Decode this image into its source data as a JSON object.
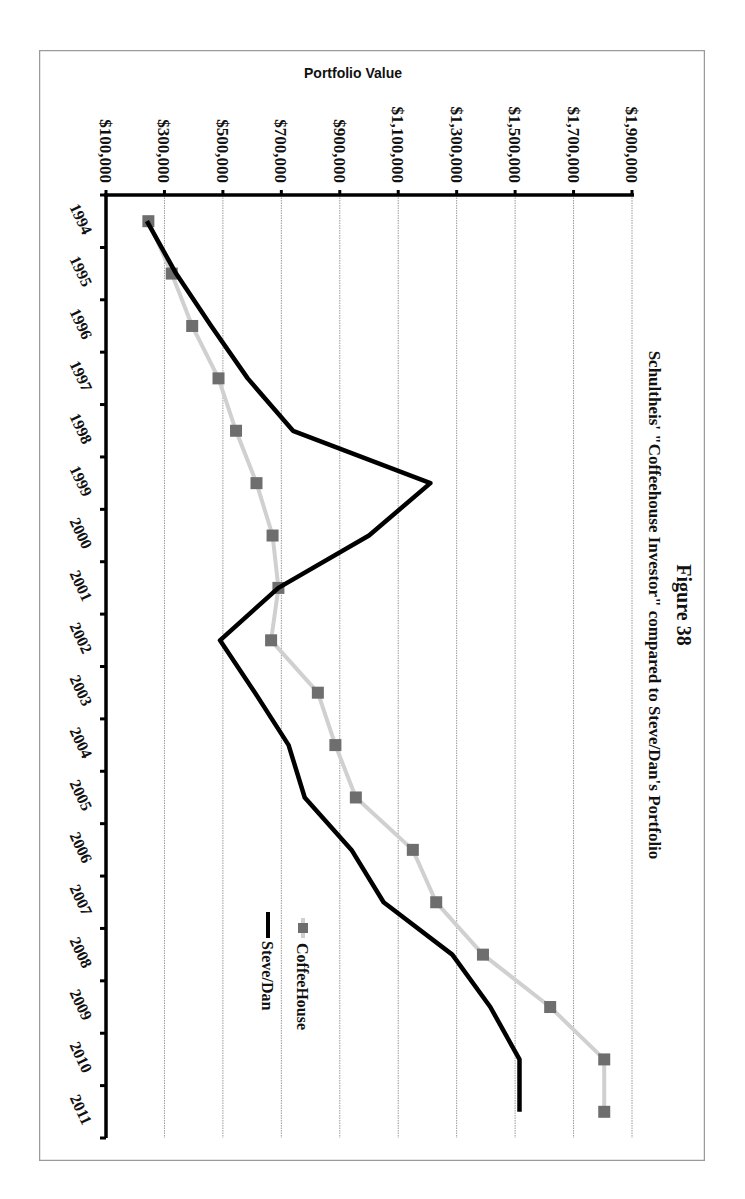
{
  "figure": {
    "label": "Figure 38",
    "subtitle": "Schultheis' \"Coffeehouse Investor\" compared to Steve/Dan's Portfolio",
    "rotation_deg": 90,
    "border_color": "#9a9a9a"
  },
  "chart_data": {
    "type": "line",
    "title": "Figure 38",
    "subtitle": "Schultheis' \"Coffeehouse Investor\" compared to Steve/Dan's Portfolio",
    "xlabel": "",
    "ylabel": "Portfolio Value",
    "categories": [
      "1994",
      "1995",
      "1996",
      "1997",
      "1998",
      "1999",
      "2000",
      "2001",
      "2002",
      "2003",
      "2004",
      "2005",
      "2006",
      "2007",
      "2008",
      "2009",
      "2010",
      "2011"
    ],
    "yticks": [
      "$100,000",
      "$300,000",
      "$500,000",
      "$700,000",
      "$900,000",
      "$1,100,000",
      "$1,300,000",
      "$1,500,000",
      "$1,700,000",
      "$1,900,000"
    ],
    "ylim": [
      100000,
      1900000
    ],
    "grid": true,
    "legend_position": "inside-right",
    "series": [
      {
        "name": "CoffeeHouse",
        "color": "#d0d0d0",
        "marker": "square",
        "marker_color": "#6e6e6e",
        "values": [
          245000,
          325000,
          395000,
          485000,
          545000,
          615000,
          670000,
          690000,
          665000,
          825000,
          885000,
          955000,
          1150000,
          1230000,
          1390000,
          1620000,
          1805000,
          1805000
        ]
      },
      {
        "name": "Steve/Dan",
        "color": "#000000",
        "marker": "none",
        "values": [
          240000,
          340000,
          460000,
          585000,
          740000,
          1210000,
          1000000,
          690000,
          490000,
          610000,
          725000,
          780000,
          940000,
          1050000,
          1285000,
          1415000,
          1515000,
          1515000
        ]
      }
    ],
    "note": "Whole figure is rendered rotated 90 degrees clockwise on the page."
  }
}
